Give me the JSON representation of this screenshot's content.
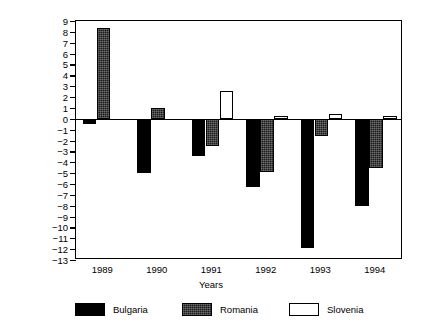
{
  "chart_data": {
    "type": "bar",
    "title": "",
    "xlabel": "Years",
    "ylabel": "In per cent of GDP",
    "categories": [
      "1989",
      "1990",
      "1991",
      "1992",
      "1993",
      "1994"
    ],
    "series": [
      {
        "name": "Bulgaria",
        "color": "#000000",
        "fill": "solid-black",
        "values": [
          -0.5,
          -5.0,
          -3.4,
          -6.3,
          -11.9,
          -8.0
        ]
      },
      {
        "name": "Romania",
        "color": "#1b1b1b",
        "fill": "dense-stipple",
        "values": [
          8.4,
          1.0,
          -2.5,
          -4.9,
          -1.6,
          -4.5
        ]
      },
      {
        "name": "Slovenia",
        "color": "#ffffff",
        "fill": "white-outline",
        "values": [
          null,
          null,
          2.6,
          0.3,
          0.4,
          0.25
        ]
      }
    ],
    "ylim": [
      -13,
      9
    ],
    "yticks": [
      9,
      8,
      7,
      6,
      5,
      4,
      3,
      2,
      1,
      0,
      -1,
      -2,
      -3,
      -4,
      -5,
      -6,
      -7,
      -8,
      -9,
      -10,
      -11,
      -12,
      -13
    ],
    "ytick_labels": [
      "9",
      "8",
      "7",
      "6",
      "5",
      "4",
      "3",
      "2",
      "1",
      "0",
      "−1",
      "−2",
      "−3",
      "−4",
      "−5",
      "−6",
      "−7",
      "−8",
      "−9",
      "−10",
      "−11",
      "−12",
      "−13"
    ],
    "grid": false,
    "legend_position": "bottom",
    "zero_line": true,
    "frame": true
  },
  "legend": {
    "items": [
      {
        "label": "Bulgaria",
        "style": "bulgaria"
      },
      {
        "label": "Romania",
        "style": "romania"
      },
      {
        "label": "Slovenia",
        "style": "slovenia"
      }
    ]
  }
}
